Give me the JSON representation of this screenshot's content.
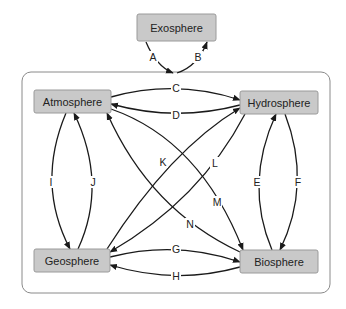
{
  "diagram": {
    "container": {
      "x": 22,
      "y": 72,
      "width": 308,
      "height": 221,
      "radius": 9
    },
    "nodes": {
      "exosphere": {
        "label": "Exosphere",
        "x": 137,
        "y": 14,
        "w": 79,
        "h": 27
      },
      "atmosphere": {
        "label": "Atmosphere",
        "x": 34,
        "y": 90,
        "w": 77,
        "h": 23
      },
      "hydrosphere": {
        "label": "Hydrosphere",
        "x": 240,
        "y": 91,
        "w": 78,
        "h": 23
      },
      "geosphere": {
        "label": "Geosphere",
        "x": 34,
        "y": 249,
        "w": 76,
        "h": 23
      },
      "biosphere": {
        "label": "Biosphere",
        "x": 240,
        "y": 250,
        "w": 78,
        "h": 23
      }
    },
    "edges": [
      {
        "id": "A",
        "label": "A",
        "from": "exosphere",
        "to": "earth-system",
        "path": "M146 42 Q156 66 173 73",
        "lx": 153,
        "ly": 57
      },
      {
        "id": "B",
        "label": "B",
        "from": "earth-system",
        "to": "exosphere",
        "path": "M177 73 Q198 66 207 42",
        "lx": 198,
        "ly": 57
      },
      {
        "id": "C",
        "label": "C",
        "from": "atmosphere",
        "to": "hydrosphere",
        "path": "M111 97 Q176 79 240 100",
        "lx": 176,
        "ly": 88
      },
      {
        "id": "D",
        "label": "D",
        "from": "hydrosphere",
        "to": "atmosphere",
        "path": "M240 105 Q176 122 111 104",
        "lx": 176,
        "ly": 115
      },
      {
        "id": "E",
        "label": "E",
        "from": "biosphere",
        "to": "hydrosphere",
        "path": "M272 250 Q244 184 276 114",
        "lx": 257,
        "ly": 182
      },
      {
        "id": "F",
        "label": "F",
        "from": "hydrosphere",
        "to": "biosphere",
        "path": "M285 114 Q312 184 280 250",
        "lx": 298,
        "ly": 182
      },
      {
        "id": "I",
        "label": "I",
        "from": "atmosphere",
        "to": "geosphere",
        "path": "M66 113 Q36 184 70 249",
        "lx": 51,
        "ly": 182
      },
      {
        "id": "J",
        "label": "J",
        "from": "geosphere",
        "to": "atmosphere",
        "path": "M78 249 Q108 184 74 113",
        "lx": 93,
        "ly": 182
      },
      {
        "id": "K",
        "label": "K",
        "from": "geosphere",
        "to": "hydrosphere",
        "path": "M107 249 Q170 150 240 108",
        "lx": 163,
        "ly": 162
      },
      {
        "id": "L",
        "label": "L",
        "from": "hydrosphere",
        "to": "geosphere",
        "path": "M245 114 Q200 200 110 252",
        "lx": 215,
        "ly": 163
      },
      {
        "id": "M",
        "label": "M",
        "from": "atmosphere",
        "to": "biosphere",
        "path": "M111 109 Q200 140 243 250",
        "lx": 217,
        "ly": 202
      },
      {
        "id": "N",
        "label": "N",
        "from": "biosphere",
        "to": "atmosphere",
        "path": "M240 252 Q150 210 107 113",
        "lx": 190,
        "ly": 224
      },
      {
        "id": "G",
        "label": "G",
        "from": "geosphere",
        "to": "biosphere",
        "path": "M110 257 Q176 240 240 262",
        "lx": 176,
        "ly": 249
      },
      {
        "id": "H",
        "label": "H",
        "from": "biosphere",
        "to": "geosphere",
        "path": "M240 267 Q176 285 110 265",
        "lx": 176,
        "ly": 276
      }
    ],
    "colors": {
      "node_fill": "#c9c9c9",
      "node_border": "#9a9a9a",
      "edge": "#1a1a1a",
      "container_border": "#8a8a8a"
    }
  }
}
